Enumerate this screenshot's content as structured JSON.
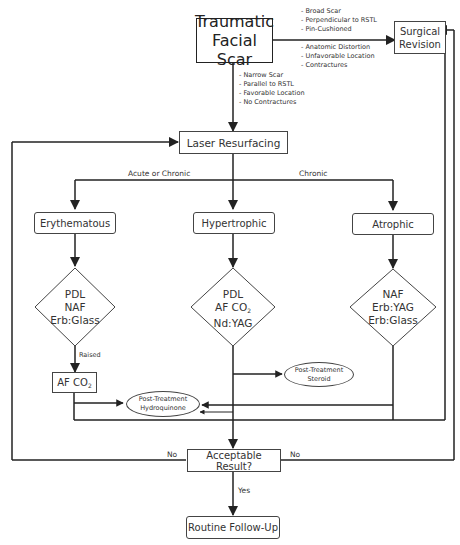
{
  "diagram": {
    "start": {
      "line1": "Traumatic",
      "line2": "Facial Scar"
    },
    "surgical_revision": {
      "line1": "Surgical",
      "line2": "Revision"
    },
    "surgery_criteria": [
      "- Broad Scar",
      "- Perpendicular to RSTL",
      "- Pin-Cushioned",
      "- Anatomic Distortion",
      "- Unfavorable Location",
      "- Contractures"
    ],
    "laser_criteria": [
      "- Narrow Scar",
      "- Parallel to RSTL",
      "- Favorable Location",
      "- No Contractures"
    ],
    "laser_resurfacing": "Laser Resurfacing",
    "branch_labels": {
      "left": "Acute or Chronic",
      "right": "Chronic"
    },
    "scar_types": {
      "erythematous": "Erythematous",
      "hypertrophic": "Hypertrophic",
      "atrophic": "Atrophic"
    },
    "treatments": {
      "erythematous": [
        "PDL",
        "NAF",
        "Erb:Glass"
      ],
      "hypertrophic": {
        "l1": "PDL",
        "l2_main": "AF CO",
        "l2_sub": "2",
        "l3": "Nd:YAG"
      },
      "atrophic": [
        "NAF",
        "Erb:YAG",
        "Erb:Glass"
      ]
    },
    "raised_label": "Raised",
    "af_co2": {
      "main": "AF CO",
      "sub": "2"
    },
    "post_steroid": {
      "line1": "Post-Treatment",
      "line2": "Steroid"
    },
    "post_hydroquinone": {
      "line1": "Post-Treatment",
      "line2": "Hydroquinone"
    },
    "acceptable": "Acceptable Result?",
    "no_left": "No",
    "no_right": "No",
    "yes": "Yes",
    "follow_up": "Routine Follow-Up",
    "colors": {
      "line": "#222222",
      "box_border": "#444444",
      "text": "#333333"
    }
  }
}
